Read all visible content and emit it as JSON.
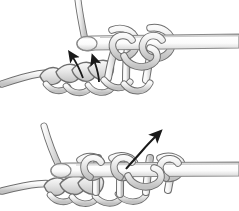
{
  "figure": {
    "panel_count": 2,
    "background_color": "#ffffff",
    "style": "grayscale line art illustration"
  },
  "colors": {
    "yarn_fill_light": "#f2f2f2",
    "yarn_fill_mid": "#d9d9d9",
    "yarn_fill_shadow": "#bfbfbf",
    "yarn_outline": "#6e6e6e",
    "hook_fill_light": "#ffffff",
    "hook_fill_mid": "#e8e8e8",
    "hook_outline": "#8a8a8a",
    "arrow_color": "#1a1a1a"
  },
  "panels": [
    {
      "id": "top-panel",
      "name": "step-one",
      "objects": [
        {
          "name": "crochet-hook",
          "description": "hook shaft entering from right edge with rounded hook tip at left"
        },
        {
          "name": "working-yarn-strand",
          "description": "yarn strand rising from hook tip to top edge"
        },
        {
          "name": "yarn-loops-on-hook",
          "description": "loops of yarn wrapped around hook shaft"
        },
        {
          "name": "foundation-chain",
          "description": "row of chain stitches across lower left"
        },
        {
          "name": "yarn-tail",
          "description": "yarn exiting at left edge"
        }
      ],
      "arrows": [
        {
          "name": "arrow-left",
          "shape": "straight",
          "direction": "up-left",
          "description": "straight arrow pointing up and to the left into stitch"
        },
        {
          "name": "arrow-right",
          "shape": "curved",
          "direction": "up",
          "description": "curved hook-shaped arrow pointing upward into stitch"
        }
      ]
    },
    {
      "id": "bottom-panel",
      "name": "step-two",
      "objects": [
        {
          "name": "crochet-hook",
          "description": "hook shaft entering from right edge with rounded hook tip at left"
        },
        {
          "name": "working-yarn-strand",
          "description": "yarn strand rising from hook tip to upper left"
        },
        {
          "name": "yarn-loops-on-hook",
          "description": "three loops of yarn over hook shaft"
        },
        {
          "name": "foundation-chain",
          "description": "row of chain stitches across lower left"
        },
        {
          "name": "yarn-tail",
          "description": "yarn exiting at left edge"
        }
      ],
      "arrows": [
        {
          "name": "arrow-pull-through",
          "shape": "curved",
          "direction": "up-right",
          "description": "curved arrow sweeping from lower left up to upper right"
        }
      ]
    }
  ]
}
